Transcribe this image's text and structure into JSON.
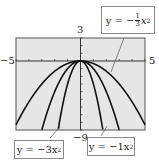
{
  "chart_data": {
    "type": "line",
    "title": "",
    "xlabel": "",
    "ylabel": "",
    "xlim": [
      -5,
      5
    ],
    "ylim": [
      -9,
      3
    ],
    "grid": false,
    "x_tick_step": 1,
    "y_tick_step": 1,
    "axis_labels": {
      "xmin": "−5",
      "xmax": "5",
      "ymax": "3",
      "ymin": "−9"
    },
    "series": [
      {
        "name": "y = −(1/3)x²",
        "a": -0.3333
      },
      {
        "name": "y = −1x²",
        "a": -1
      },
      {
        "name": "y = −3x²",
        "a": -3
      }
    ],
    "annotations": [
      {
        "text_main": "y = −",
        "frac_num": "1",
        "frac_den": "3",
        "text_tail": "x",
        "sup": "2",
        "target": "y = -(1/3)x^2"
      },
      {
        "text": "y = −3x",
        "sup": "2",
        "target": "y = -3x^2"
      },
      {
        "text": "y = −1x",
        "sup": "2",
        "target": "y = -1x^2"
      }
    ],
    "colors": {
      "plot_bg": "#e6e6e6",
      "curve": "#111111",
      "axis": "#333333"
    }
  }
}
